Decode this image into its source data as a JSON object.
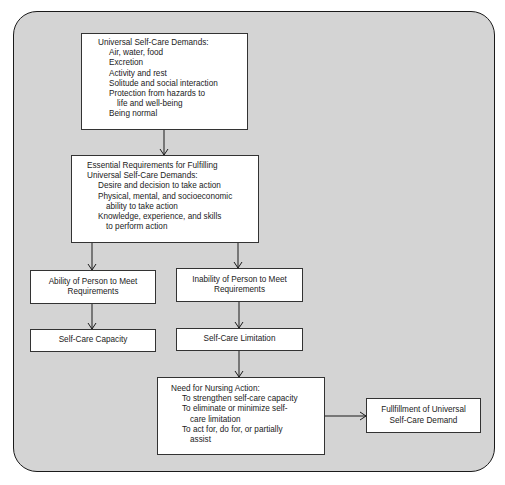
{
  "diagram": {
    "universal_demands": {
      "title": "Universal Self-Care Demands:",
      "items": [
        "Air, water, food",
        "Excretion",
        "Activity and rest",
        "Solitude and social interaction",
        "Protection from hazards to",
        "life and well-being",
        "Being normal"
      ]
    },
    "essential_requirements": {
      "title_line1": "Essential Requirements for Fulfilling",
      "title_line2": "Universal Self-Care Demands:",
      "items": [
        "Desire and decision to take action",
        "Physical, mental, and socioeconomic",
        "ability to take action",
        "Knowledge, experience, and skills",
        "to perform action"
      ]
    },
    "ability": {
      "line1": "Ability of Person to Meet",
      "line2": "Requirements"
    },
    "inability": {
      "line1": "Inability of Person to Meet",
      "line2": "Requirements"
    },
    "capacity": {
      "label": "Self-Care Capacity"
    },
    "limitation": {
      "label": "Self-Care Limitation"
    },
    "nursing_action": {
      "title": "Need for Nursing Action:",
      "items": [
        "To strengthen self-care capacity",
        "To eliminate or minimize self-",
        "care limitation",
        "To act for, do for, or partially",
        "assist"
      ]
    },
    "fulfillment": {
      "line1": "Fullfillment of Universal",
      "line2": "Self-Care Demand"
    },
    "colors": {
      "background": "#d4d4d4",
      "box": "#ffffff",
      "stroke": "#1a1a1a"
    }
  }
}
